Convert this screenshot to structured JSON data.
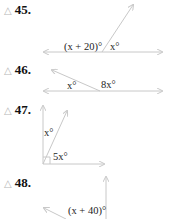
{
  "problems": [
    {
      "number": "45.",
      "marker": "△",
      "labels": {
        "left": "(x + 20)°",
        "right": "x°"
      }
    },
    {
      "number": "46.",
      "marker": "△",
      "labels": {
        "left": "x°",
        "right": "8x°"
      }
    },
    {
      "number": "47.",
      "marker": "△",
      "labels": {
        "upper": "x°",
        "lower": "5x°"
      }
    },
    {
      "number": "48.",
      "marker": "△",
      "labels": {
        "lower": "(x + 40)°"
      }
    }
  ],
  "colors": {
    "line": "#c8c8c8",
    "text": "#222222",
    "marker": "#b8b8b8"
  }
}
